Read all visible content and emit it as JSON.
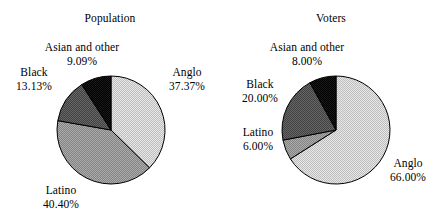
{
  "figure": {
    "background": "#ffffff",
    "text_color": "#000000"
  },
  "charts": [
    {
      "id": "population",
      "title": "Population",
      "slices": [
        {
          "label": "Anglo",
          "value_text": "37.37%",
          "value": 37.37,
          "fill": "#d0d0d0"
        },
        {
          "label": "Latino",
          "value_text": "40.40%",
          "value": 40.4,
          "fill": "#9a9a9a"
        },
        {
          "label": "Black",
          "value_text": "13.13%",
          "value": 13.13,
          "fill": "#585858"
        },
        {
          "label": "Asian and other",
          "value_text": "9.09%",
          "value": 9.09,
          "fill": "#1a1a1a"
        }
      ]
    },
    {
      "id": "voters",
      "title": "Voters",
      "slices": [
        {
          "label": "Anglo",
          "value_text": "66.00%",
          "value": 66.0,
          "fill": "#d0d0d0"
        },
        {
          "label": "Latino",
          "value_text": "6.00%",
          "value": 6.0,
          "fill": "#9a9a9a"
        },
        {
          "label": "Black",
          "value_text": "20.00%",
          "value": 20.0,
          "fill": "#585858"
        },
        {
          "label": "Asian and other",
          "value_text": "8.00%",
          "value": 8.0,
          "fill": "#1a1a1a"
        }
      ]
    }
  ],
  "chart_data": [
    {
      "type": "pie",
      "title": "Population",
      "categories": [
        "Anglo",
        "Latino",
        "Black",
        "Asian and other"
      ],
      "values": [
        37.37,
        40.4,
        13.13,
        9.09
      ],
      "value_labels": [
        "37.37%",
        "40.40%",
        "13.13%",
        "9.09%"
      ],
      "units": "percent",
      "total": 99.99,
      "start_angle_deg": 0,
      "direction": "clockwise",
      "colors": [
        "#d0d0d0",
        "#9a9a9a",
        "#585858",
        "#1a1a1a"
      ],
      "legend": "none",
      "labels_position": "outside",
      "grid": false
    },
    {
      "type": "pie",
      "title": "Voters",
      "categories": [
        "Anglo",
        "Latino",
        "Black",
        "Asian and other"
      ],
      "values": [
        66.0,
        6.0,
        20.0,
        8.0
      ],
      "value_labels": [
        "66.00%",
        "6.00%",
        "20.00%",
        "8.00%"
      ],
      "units": "percent",
      "total": 100.0,
      "start_angle_deg": 0,
      "direction": "clockwise",
      "colors": [
        "#d0d0d0",
        "#9a9a9a",
        "#585858",
        "#1a1a1a"
      ],
      "legend": "none",
      "labels_position": "outside",
      "grid": false
    }
  ]
}
